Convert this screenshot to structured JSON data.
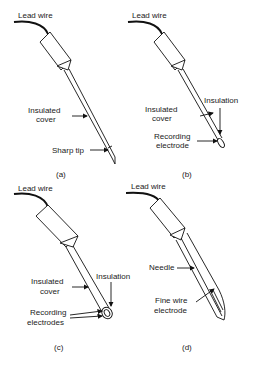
{
  "figure": {
    "panels": [
      {
        "id": "a",
        "caption": "(a)",
        "labels": {
          "lead_wire": "Lead wire",
          "insulated_cover_1": "Insulated",
          "insulated_cover_2": "cover",
          "tip": "Sharp tip"
        }
      },
      {
        "id": "b",
        "caption": "(b)",
        "labels": {
          "lead_wire": "Lead wire",
          "insulated_cover_1": "Insulated",
          "insulated_cover_2": "cover",
          "insulation": "Insulation",
          "recording_1": "Recording",
          "recording_2": "electrode"
        }
      },
      {
        "id": "c",
        "caption": "(c)",
        "labels": {
          "lead_wire": "Lead wire",
          "insulated_cover_1": "Insulated",
          "insulated_cover_2": "cover",
          "insulation": "Insulation",
          "recording_1": "Recording",
          "recording_2": "electrodes"
        }
      },
      {
        "id": "d",
        "caption": "(d)",
        "labels": {
          "lead_wire": "Lead wire",
          "needle": "Needle",
          "fine_wire_1": "Fine wire",
          "fine_wire_2": "electrode"
        }
      }
    ]
  }
}
